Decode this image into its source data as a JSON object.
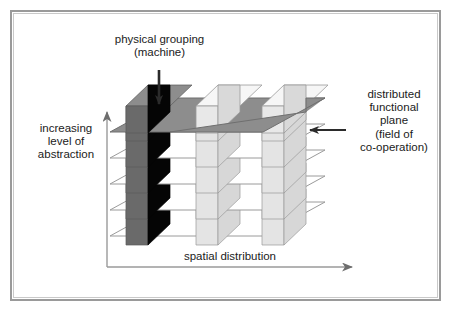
{
  "figure": {
    "labels": {
      "physical_grouping": "physical grouping\n(machine)",
      "distributed_plane": "distributed\nfunctional\nplane\n(field of\nco-operation)",
      "y_axis": "increasing\nlevel of\nabstraction",
      "x_axis": "spatial distribution"
    },
    "colors": {
      "background": "#ffffff",
      "frame_outer": "#9a9a9a",
      "frame_inner": "#c9c9c9",
      "text": "#1b1b1b",
      "axis": "#8f8f8f",
      "arrow": "#2b2b2b",
      "top_plane_fill": "#8d8d8d",
      "top_plane_stroke": "#6f6f6f",
      "lower_plane_fill": "#ffffff",
      "lower_plane_stroke": "#9a9a9a",
      "dark_box_top": "#8d8d8d",
      "dark_box_left": "#6a6a6a",
      "dark_box_front": "#050505",
      "light_box_top": "#f4f4f4",
      "light_box_left": "#d7d7d7",
      "light_box_front": "#e4e4e4",
      "light_box_stroke": "#9a9a9a"
    },
    "structure": {
      "plane_count": 5,
      "column_count": 3,
      "plane_labels": [
        "plane-1-top",
        "plane-2",
        "plane-3",
        "plane-4",
        "plane-5-bottom"
      ],
      "column_labels": [
        "column-1-machine",
        "column-2",
        "column-3"
      ],
      "highlighted_column": "column-1-machine"
    },
    "axes": {
      "vertical_direction": "up",
      "horizontal_direction": "right"
    }
  }
}
